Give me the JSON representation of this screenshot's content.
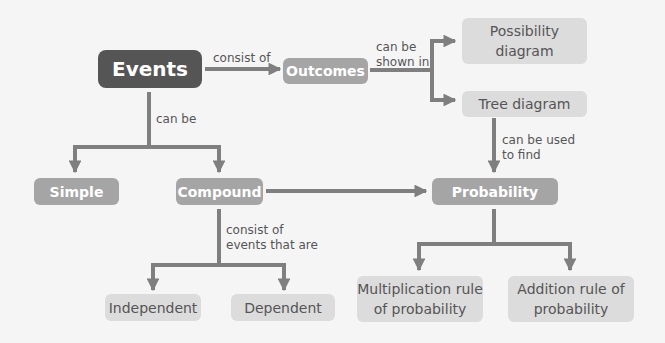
{
  "colors": {
    "background": "#f5f5f5",
    "dark_node": "#555555",
    "mid_node": "#a5a5a5",
    "light_node": "#dcdcdc",
    "connector": "#7f7f7f",
    "label_text": "#555555"
  },
  "nodes": {
    "events": "Events",
    "outcomes": "Outcomes",
    "possibility_diagram": "Possibility\ndiagram",
    "tree_diagram": "Tree diagram",
    "simple": "Simple",
    "compound": "Compound",
    "probability": "Probability",
    "independent": "Independent",
    "dependent": "Dependent",
    "multiplication_rule": "Multiplication rule\nof probability",
    "addition_rule": "Addition rule of\nprobability"
  },
  "edge_labels": {
    "consist_of": "consist of",
    "can_be_shown_in": "can be\nshown in",
    "can_be": "can be",
    "can_be_used_to_find": "can be used\nto find",
    "consist_of_events_that_are": "consist of\nevents that are"
  },
  "edges": [
    {
      "from": "events",
      "to": "outcomes",
      "label": "consist_of"
    },
    {
      "from": "outcomes",
      "to": "possibility_diagram",
      "label": "can_be_shown_in"
    },
    {
      "from": "outcomes",
      "to": "tree_diagram",
      "label": "can_be_shown_in"
    },
    {
      "from": "events",
      "to": "simple",
      "label": "can_be"
    },
    {
      "from": "events",
      "to": "compound",
      "label": "can_be"
    },
    {
      "from": "tree_diagram",
      "to": "probability",
      "label": "can_be_used_to_find"
    },
    {
      "from": "compound",
      "to": "probability",
      "label": ""
    },
    {
      "from": "compound",
      "to": "independent",
      "label": "consist_of_events_that_are"
    },
    {
      "from": "compound",
      "to": "dependent",
      "label": "consist_of_events_that_are"
    },
    {
      "from": "probability",
      "to": "multiplication_rule",
      "label": ""
    },
    {
      "from": "probability",
      "to": "addition_rule",
      "label": ""
    }
  ]
}
